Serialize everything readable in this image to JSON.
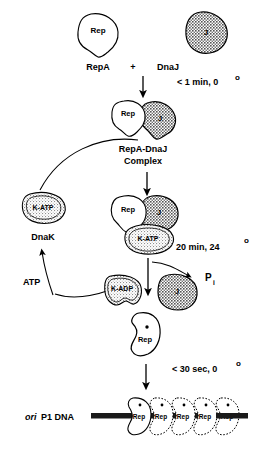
{
  "figure": {
    "colors": {
      "stroke": "#000000",
      "background": "#ffffff",
      "rep_fill": "#ffffff",
      "dnaj_fill": "#b0b0b0",
      "dnak_fill": "#dcdcdc",
      "dna_bar": "#1a1a1a"
    }
  },
  "step1": {
    "repa_blob_label": "Rep",
    "dnaj_blob_label": "J",
    "repa_name": "RepA",
    "plus_sign": "+",
    "dnaj_name": "DnaJ",
    "condition": "< 1 min, 0",
    "condition_degree": "o"
  },
  "step2": {
    "rep_blob_label": "Rep",
    "dnaj_blob_label": "J",
    "complex_name_line1": "RepA-DnaJ",
    "complex_name_line2": "Complex"
  },
  "chaperone_cycle": {
    "katp_blob_label": "K-ATP",
    "dnak_name": "DnaK",
    "atp_label": "ATP",
    "kadp_blob_label": "K-ADP"
  },
  "step3": {
    "rep_blob_label": "Rep",
    "dnaj_blob_label": "J",
    "katp_blob_label": "K-ATP",
    "condition": "20 min, 24",
    "condition_degree": "o",
    "phosphate_label": "P",
    "phosphate_subscript": "i",
    "released_dnaj_label": "J"
  },
  "step4": {
    "activated_rep_label": "Rep",
    "activation_mark": "*",
    "condition": "< 30 sec, 0",
    "condition_degree": "o"
  },
  "step5": {
    "ori_italic": "ori",
    "dna_name": "P1 DNA",
    "bound_rep_monomers": [
      {
        "label": "Rep",
        "mark": "*",
        "outline": "solid"
      },
      {
        "label": "Rep",
        "mark": "*",
        "outline": "dotted"
      },
      {
        "label": "Rep",
        "mark": "*",
        "outline": "dotted"
      },
      {
        "label": "Rep",
        "mark": "*",
        "outline": "dotted"
      },
      {
        "label": "Rep",
        "mark": "*",
        "outline": "dotted"
      }
    ]
  }
}
